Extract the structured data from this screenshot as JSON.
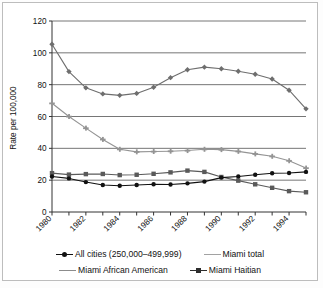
{
  "chart_data": {
    "type": "line",
    "title": "",
    "xlabel": "",
    "ylabel": "Rate per 100,000",
    "xlim": [
      1980,
      1995
    ],
    "ylim": [
      0,
      120
    ],
    "ytick_step": 20,
    "yticks": [
      0,
      20,
      40,
      60,
      80,
      100,
      120
    ],
    "xticks": [
      1980,
      1981,
      1982,
      1983,
      1984,
      1985,
      1986,
      1987,
      1988,
      1989,
      1990,
      1991,
      1992,
      1993,
      1994,
      1995
    ],
    "xtick_labels": [
      "1980",
      "",
      "1982",
      "",
      "1984",
      "",
      "1986",
      "",
      "1988",
      "",
      "1990",
      "",
      "1992",
      "",
      "1994",
      ""
    ],
    "grid": "horizontal",
    "legend_position": "bottom",
    "x": [
      1980,
      1981,
      1982,
      1983,
      1984,
      1985,
      1986,
      1987,
      1988,
      1989,
      1990,
      1991,
      1992,
      1993,
      1994,
      1995
    ],
    "series": [
      {
        "name": "Miami Haitian",
        "legend_label": "Miami Haitian",
        "marker": "diamond",
        "color": "#6e6e6e",
        "values": [
          105.4,
          88.2,
          78.0,
          74.2,
          73.3,
          74.5,
          78.4,
          84.4,
          89.4,
          91.0,
          90.0,
          88.4,
          86.5,
          83.6,
          76.5,
          64.8
        ]
      },
      {
        "name": "Miami African American",
        "legend_label": "Miami African American",
        "marker": "cross",
        "color": "#949494",
        "values": [
          68.3,
          60.0,
          52.7,
          45.6,
          39.4,
          37.8,
          38.0,
          38.2,
          38.6,
          39.4,
          39.2,
          38.1,
          36.5,
          35.0,
          32.2,
          27.6
        ]
      },
      {
        "name": "Miami total",
        "legend_label": "Miami total",
        "marker": "square",
        "color": "#5a5a5a",
        "values": [
          24.4,
          23.5,
          23.8,
          23.9,
          23.2,
          23.4,
          24.0,
          24.9,
          26.0,
          25.2,
          22.0,
          19.7,
          17.4,
          15.2,
          13.1,
          12.4
        ]
      },
      {
        "name": "All cities (250,000-499,999)",
        "legend_label": "All cities (250,000–499,999)",
        "marker": "circle",
        "color": "#111111",
        "values": [
          22.3,
          21.1,
          18.8,
          17.0,
          16.5,
          17.0,
          17.4,
          17.3,
          18.0,
          19.1,
          21.6,
          22.3,
          23.4,
          24.3,
          24.5,
          25.2
        ]
      }
    ],
    "legend_entries": [
      {
        "label": "All cities (250,000–499,999)",
        "marker": "circle",
        "color": "#111111"
      },
      {
        "label": "Miami total",
        "marker": "cross",
        "color": "#a2a2a2"
      },
      {
        "label": "Miami African American",
        "marker": "cross",
        "color": "#8c8c8c"
      },
      {
        "label": "Miami Haitian",
        "marker": "square",
        "color": "#2e2e2e"
      }
    ]
  },
  "axis": {
    "ylabel": "Rate per 100,000"
  }
}
